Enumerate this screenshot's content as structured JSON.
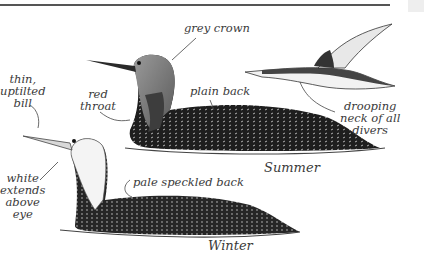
{
  "figure": {
    "labels": {
      "grey_crown": "grey crown",
      "thin_bill": "thin,\nuptilted\nbill",
      "red_throat": "red\nthroat",
      "plain_back": "plain back",
      "drooping_neck": "drooping\nneck of all\ndivers",
      "white_extends": "white\nextends\nabove\neye",
      "pale_speckled_back": "pale speckled back",
      "summer": "Summer",
      "winter": "Winter"
    },
    "colors": {
      "ink": "#2a2a2a",
      "grey_head": "#8a8a8a",
      "dark_throat": "#3d3d3d",
      "paper": "#ffffff"
    }
  }
}
